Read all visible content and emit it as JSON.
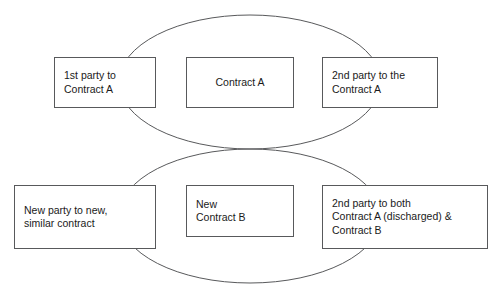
{
  "diagram": {
    "stroke_color": "#58595b",
    "text_color": "#1a1a1a",
    "background_color": "#ffffff",
    "shapes": {
      "ellipse_top": {
        "name": "Contract A relationship ellipse",
        "cx": 250,
        "cy": 82,
        "rx": 131,
        "ry": 67
      },
      "ellipse_bottom": {
        "name": "Contract B relationship ellipse",
        "cx": 250,
        "cy": 216,
        "rx": 131,
        "ry": 67
      }
    },
    "boxes": {
      "first_party_a": {
        "label": "1st party to\nContract A",
        "align": "left"
      },
      "contract_a": {
        "label": "Contract A",
        "align": "center"
      },
      "second_party_a": {
        "label": "2nd party to the\nContract A",
        "align": "left"
      },
      "new_party": {
        "label": "New party to new,\nsimilar contract",
        "align": "left"
      },
      "new_contract_b": {
        "label": "New\nContract B",
        "align": "left"
      },
      "second_party_both": {
        "label": "2nd party to both\nContract A (discharged) &\nContract B",
        "align": "left"
      }
    }
  }
}
